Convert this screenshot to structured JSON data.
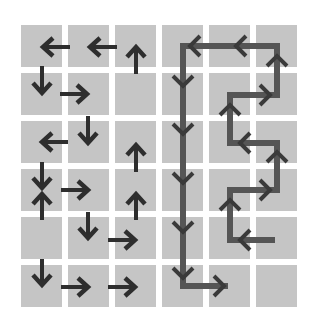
{
  "diagram": {
    "title": "",
    "grid": {
      "rows": 6,
      "cols": 6,
      "origin_x": 21,
      "origin_y": 25,
      "cell_w": 41,
      "cell_h": 42,
      "pitch_x": 47,
      "pitch_y": 48,
      "cell_color": "#c5c5c5",
      "background": "#ffffff"
    },
    "arrow_color": "#2e2e2e",
    "path_color": "#555555",
    "arrows": [
      {
        "dir": "left",
        "x1": 70,
        "y1": 47,
        "x2": 43,
        "y2": 47
      },
      {
        "dir": "left",
        "x1": 117,
        "y1": 47,
        "x2": 90,
        "y2": 47
      },
      {
        "dir": "up",
        "x1": 136,
        "y1": 74,
        "x2": 136,
        "y2": 47
      },
      {
        "dir": "down",
        "x1": 42,
        "y1": 66,
        "x2": 42,
        "y2": 93
      },
      {
        "dir": "right",
        "x1": 60,
        "y1": 94,
        "x2": 87,
        "y2": 94
      },
      {
        "dir": "down",
        "x1": 88,
        "y1": 116,
        "x2": 88,
        "y2": 143
      },
      {
        "dir": "left",
        "x1": 68,
        "y1": 142,
        "x2": 42,
        "y2": 142
      },
      {
        "dir": "up",
        "x1": 136,
        "y1": 172,
        "x2": 136,
        "y2": 145
      },
      {
        "dir": "down",
        "x1": 42,
        "y1": 162,
        "x2": 42,
        "y2": 188
      },
      {
        "dir": "up",
        "x1": 42,
        "y1": 220,
        "x2": 42,
        "y2": 194
      },
      {
        "dir": "right",
        "x1": 61,
        "y1": 190,
        "x2": 88,
        "y2": 190
      },
      {
        "dir": "up",
        "x1": 136,
        "y1": 220,
        "x2": 136,
        "y2": 194
      },
      {
        "dir": "down",
        "x1": 88,
        "y1": 212,
        "x2": 88,
        "y2": 238
      },
      {
        "dir": "right",
        "x1": 108,
        "y1": 240,
        "x2": 135,
        "y2": 240
      },
      {
        "dir": "down",
        "x1": 42,
        "y1": 259,
        "x2": 42,
        "y2": 285
      },
      {
        "dir": "right",
        "x1": 61,
        "y1": 287,
        "x2": 88,
        "y2": 287
      },
      {
        "dir": "right",
        "x1": 108,
        "y1": 287,
        "x2": 135,
        "y2": 287
      }
    ],
    "path": {
      "points": [
        [
          275,
          240
        ],
        [
          230,
          240
        ],
        [
          230,
          190
        ],
        [
          277,
          190
        ],
        [
          277,
          143
        ],
        [
          230,
          143
        ],
        [
          230,
          95
        ],
        [
          277,
          95
        ],
        [
          277,
          46
        ],
        [
          183,
          46
        ],
        [
          183,
          286
        ],
        [
          228,
          286
        ]
      ],
      "chevrons": [
        {
          "dir": "left",
          "x": 240,
          "y": 240
        },
        {
          "dir": "up",
          "x": 230,
          "y": 200
        },
        {
          "dir": "right",
          "x": 270,
          "y": 190
        },
        {
          "dir": "up",
          "x": 277,
          "y": 152
        },
        {
          "dir": "left",
          "x": 240,
          "y": 143
        },
        {
          "dir": "up",
          "x": 230,
          "y": 105
        },
        {
          "dir": "right",
          "x": 270,
          "y": 95
        },
        {
          "dir": "up",
          "x": 277,
          "y": 56
        },
        {
          "dir": "left",
          "x": 236,
          "y": 46
        },
        {
          "dir": "left",
          "x": 190,
          "y": 46
        },
        {
          "dir": "down",
          "x": 183,
          "y": 86
        },
        {
          "dir": "down",
          "x": 183,
          "y": 134
        },
        {
          "dir": "down",
          "x": 183,
          "y": 183
        },
        {
          "dir": "down",
          "x": 183,
          "y": 232
        },
        {
          "dir": "down",
          "x": 183,
          "y": 278
        },
        {
          "dir": "right",
          "x": 224,
          "y": 286
        }
      ]
    }
  }
}
